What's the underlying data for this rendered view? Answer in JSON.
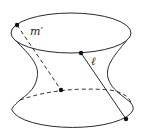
{
  "figure": {
    "labels": {
      "line_m": "m′",
      "line_l": "ℓ"
    },
    "colors": {
      "stroke": "#2a2a2a",
      "background": "#ffffff"
    },
    "points": {
      "m_top": [
        17,
        25
      ],
      "m_bottom": [
        61,
        90
      ],
      "l_top": [
        81,
        53
      ],
      "l_bottom": [
        126,
        119
      ]
    }
  }
}
